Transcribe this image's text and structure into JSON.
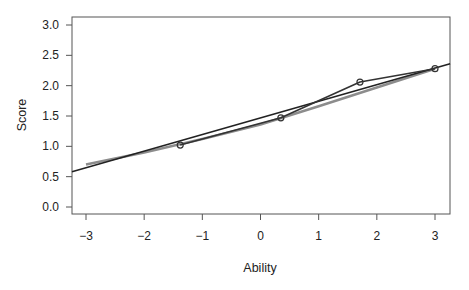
{
  "chart_data": {
    "type": "line",
    "title": "",
    "xlabel": "Ability",
    "ylabel": "Score",
    "xlim": [
      -3.24,
      3.26
    ],
    "ylim": [
      -0.12,
      3.12
    ],
    "xticks": [
      -3,
      -2,
      -1,
      0,
      1,
      2,
      3
    ],
    "xtick_labels": [
      "−3",
      "−2",
      "−1",
      "0",
      "1",
      "2",
      "3"
    ],
    "yticks": [
      0.0,
      0.5,
      1.0,
      1.5,
      2.0,
      2.5,
      3.0
    ],
    "ytick_labels": [
      "0.0",
      "0.5",
      "1.0",
      "1.5",
      "2.0",
      "2.5",
      "3.0"
    ],
    "grid": false,
    "legend": null,
    "series": [
      {
        "name": "observed",
        "style": "line+points",
        "color": "#333333",
        "x": [
          -1.38,
          0.35,
          1.71,
          3.0
        ],
        "y": [
          1.02,
          1.47,
          2.06,
          2.28
        ]
      },
      {
        "name": "expected (gray curve)",
        "style": "line",
        "color": "#8c8c8c",
        "x": [
          -3.0,
          -2.0,
          -1.0,
          0.0,
          1.0,
          2.0,
          3.0
        ],
        "y": [
          0.7,
          0.9,
          1.12,
          1.36,
          1.66,
          1.97,
          2.28
        ]
      },
      {
        "name": "fitted line",
        "style": "line",
        "color": "#222222",
        "x": [
          -3.24,
          3.26
        ],
        "y": [
          0.58,
          2.36
        ]
      }
    ]
  }
}
